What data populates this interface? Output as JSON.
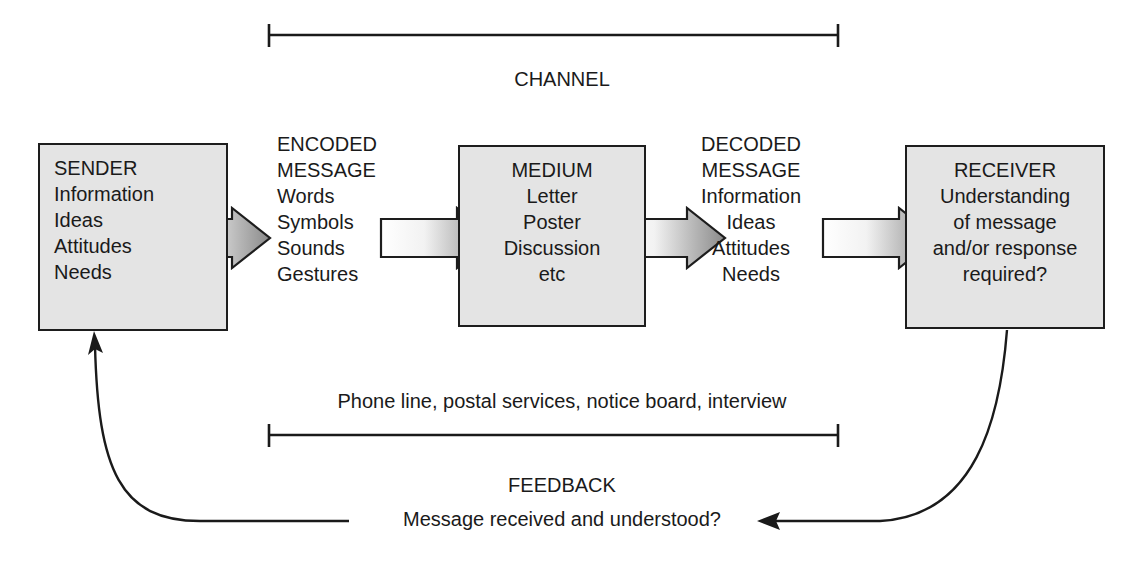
{
  "diagram": {
    "colors": {
      "box_fill": "#e4e4e4",
      "box_border": "#1d1d1d",
      "arrow_dark": "#8a8a8a",
      "arrow_light": "#ffffff",
      "line": "#1a1a1a",
      "text": "#1a1a1a"
    },
    "top_bracket": {
      "label": "CHANNEL"
    },
    "bottom_bracket": {
      "label": "Phone line, postal services, notice board, interview"
    },
    "feedback": {
      "title": "FEEDBACK",
      "text": "Message received and understood?"
    },
    "nodes": [
      {
        "id": "sender",
        "kind": "box",
        "align": "left",
        "lines": [
          "SENDER",
          "Information",
          "Ideas",
          "Attitudes",
          "Needs"
        ]
      },
      {
        "id": "encoded-message",
        "kind": "label",
        "align": "left",
        "lines": [
          "ENCODED",
          "MESSAGE",
          "Words",
          "Symbols",
          "Sounds",
          "Gestures"
        ]
      },
      {
        "id": "medium",
        "kind": "box",
        "align": "center",
        "lines": [
          "MEDIUM",
          "Letter",
          "Poster",
          "Discussion",
          "etc"
        ]
      },
      {
        "id": "decoded-message",
        "kind": "label",
        "align": "center",
        "lines": [
          "DECODED",
          "MESSAGE",
          "Information",
          "Ideas",
          "Attitudes",
          "Needs"
        ]
      },
      {
        "id": "receiver",
        "kind": "box",
        "align": "center",
        "lines": [
          "RECEIVER",
          "Understanding",
          "of message",
          "and/or response",
          "required?"
        ]
      }
    ],
    "flow_arrows": [
      {
        "id": "arrow-sender-to-encoded"
      },
      {
        "id": "arrow-encoded-to-medium"
      },
      {
        "id": "arrow-medium-to-decoded"
      },
      {
        "id": "arrow-decoded-to-receiver"
      }
    ]
  }
}
